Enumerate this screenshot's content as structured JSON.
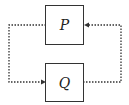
{
  "diagram": {
    "type": "feedback-loop",
    "nodes": [
      {
        "id": "P",
        "label": "P"
      },
      {
        "id": "Q",
        "label": "Q"
      }
    ],
    "edges": [
      {
        "from": "P",
        "to": "Q",
        "style": "dotted",
        "route": "left"
      },
      {
        "from": "Q",
        "to": "P",
        "style": "dotted",
        "route": "right"
      }
    ],
    "colors": {
      "line": "#333333",
      "background": "#ffffff"
    }
  }
}
